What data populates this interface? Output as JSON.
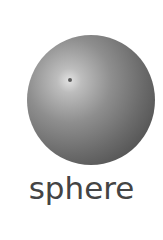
{
  "figure": {
    "shape": "sphere-icon",
    "label": "sphere",
    "colors": {
      "background": "#ffffff",
      "sphere_light": "#e2e2e2",
      "sphere_dark": "#3e3e3e",
      "text": "#444444"
    }
  }
}
